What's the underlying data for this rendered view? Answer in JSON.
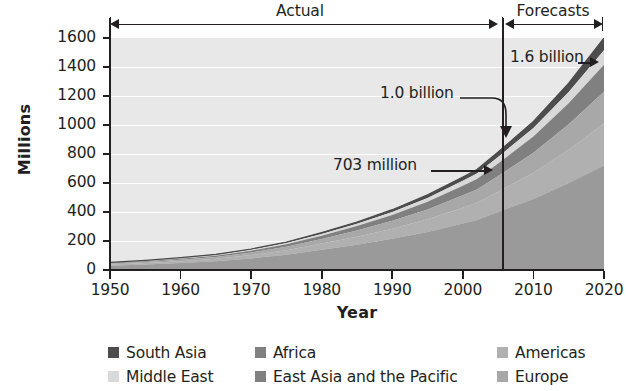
{
  "chart_data": {
    "type": "area",
    "stacked": true,
    "title": "",
    "xlabel": "Year",
    "ylabel": "Millions",
    "xlim": [
      1950,
      2020
    ],
    "ylim": [
      0,
      1600
    ],
    "yticks": [
      0,
      200,
      400,
      600,
      800,
      1000,
      1200,
      1400,
      1600
    ],
    "xticks": [
      1950,
      1960,
      1970,
      1980,
      1990,
      2000,
      2010,
      2020
    ],
    "grid": true,
    "legend_position": "bottom",
    "x": [
      1950,
      1955,
      1960,
      1965,
      1970,
      1975,
      1980,
      1985,
      1990,
      1995,
      2000,
      2002,
      2005,
      2010,
      2015,
      2020
    ],
    "series": [
      {
        "name": "East Asia and the Pacific",
        "color": "#9a9a9a",
        "values": [
          30,
          38,
          48,
          60,
          80,
          105,
          140,
          175,
          215,
          262,
          320,
          345,
          400,
          490,
          600,
          720
        ]
      },
      {
        "name": "Americas",
        "color": "#b0b0b0",
        "values": [
          8,
          10,
          13,
          17,
          23,
          31,
          42,
          55,
          70,
          88,
          110,
          118,
          140,
          180,
          230,
          290
        ]
      },
      {
        "name": "Europe",
        "color": "#a8a8a8",
        "values": [
          6,
          8,
          10,
          13,
          18,
          24,
          32,
          42,
          54,
          68,
          85,
          92,
          108,
          138,
          175,
          220
        ]
      },
      {
        "name": "Africa",
        "color": "#808080",
        "values": [
          4,
          5,
          7,
          9,
          12,
          17,
          23,
          31,
          40,
          52,
          66,
          72,
          86,
          112,
          145,
          185
        ]
      },
      {
        "name": "Middle East",
        "color": "#d9d9d9",
        "values": [
          2,
          3,
          4,
          5,
          7,
          9,
          12,
          16,
          21,
          27,
          35,
          38,
          46,
          60,
          78,
          100
        ]
      },
      {
        "name": "South Asia",
        "color": "#4d4d4d",
        "values": [
          2,
          2,
          3,
          4,
          5,
          7,
          9,
          12,
          16,
          21,
          26,
          28,
          34,
          45,
          60,
          85
        ]
      }
    ],
    "totals": [
      52,
      66,
      85,
      108,
      145,
      193,
      258,
      331,
      416,
      518,
      642,
      703,
      814,
      1025,
      1288,
      1600
    ],
    "annotations": [
      {
        "text": "703 million",
        "x": 2002,
        "y": 703
      },
      {
        "text": "1.0 billion",
        "x": 2010,
        "y": 1025
      },
      {
        "text": "1.6 billion",
        "x": 2020,
        "y": 1600
      }
    ],
    "period_bands": [
      {
        "label": "Actual",
        "from": 1950,
        "to": 2002
      },
      {
        "label": "Forecasts",
        "from": 2002,
        "to": 2020
      }
    ]
  },
  "axes": {
    "y_title": "Millions",
    "x_title": "Year",
    "y_ticks": [
      "0",
      "200",
      "400",
      "600",
      "800",
      "1000",
      "1200",
      "1400",
      "1600"
    ],
    "x_ticks": [
      "1950",
      "1960",
      "1970",
      "1980",
      "1990",
      "2000",
      "2010",
      "2020"
    ]
  },
  "periods": {
    "actual_label": "Actual",
    "forecasts_label": "Forecasts"
  },
  "callouts": {
    "a703": "703 million",
    "a10": "1.0 billion",
    "a16": "1.6 billion"
  },
  "legend": {
    "items": [
      {
        "label": "South Asia",
        "color": "#4d4d4d"
      },
      {
        "label": "Africa",
        "color": "#808080"
      },
      {
        "label": "Americas",
        "color": "#b0b0b0"
      },
      {
        "label": "Middle East",
        "color": "#d9d9d9"
      },
      {
        "label": "East Asia and the Pacific",
        "color": "#808080"
      },
      {
        "label": "Europe",
        "color": "#a8a8a8"
      }
    ]
  }
}
